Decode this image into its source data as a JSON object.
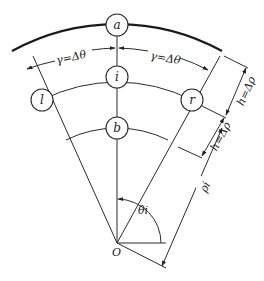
{
  "diagram": {
    "type": "polar-grid-finite-difference-stencil",
    "nodes": {
      "a": "a",
      "i": "i",
      "b": "b",
      "l": "l",
      "r": "r"
    },
    "origin_label": "O",
    "dimensions": {
      "left_arc": "γ=Δθ",
      "right_arc": "γ=Δθ",
      "upper_radial": "h=Δρ",
      "lower_radial": "h=Δρ",
      "radius": "ρi",
      "angle": "θi"
    },
    "colors": {
      "line": "#2a2a2a",
      "background": "#ffffff"
    }
  }
}
